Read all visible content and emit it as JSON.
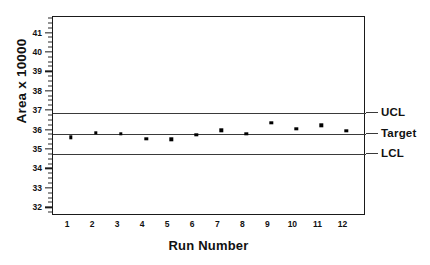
{
  "chart_data": {
    "type": "scatter",
    "title": "",
    "xlabel": "Run Number",
    "ylabel": "Area x 10000",
    "xlim": [
      0.4,
      12.9
    ],
    "ylim": [
      31.6,
      41.85
    ],
    "grid": false,
    "legend_position": "right-outside",
    "x": [
      1,
      2,
      3,
      4,
      5,
      6,
      7,
      8,
      9,
      10,
      11,
      12
    ],
    "categories": [
      "1",
      "2",
      "3",
      "4",
      "5",
      "6",
      "7",
      "8",
      "9",
      "10",
      "11",
      "12"
    ],
    "series": [
      {
        "name": "Area",
        "values": [
          35.66,
          35.89,
          35.83,
          35.58,
          35.55,
          35.77,
          36.02,
          35.82,
          36.4,
          36.1,
          36.28,
          36.0
        ]
      }
    ],
    "reference_lines": [
      {
        "name": "UCL",
        "label": "UCL",
        "value": 36.9
      },
      {
        "name": "Target",
        "label": "Target",
        "value": 35.82
      },
      {
        "name": "LCL",
        "label": "LCL",
        "value": 34.8
      }
    ],
    "y_ticks": [
      32,
      33,
      34,
      35,
      36,
      37,
      38,
      39,
      40,
      41
    ],
    "y_tick_labels": [
      "32",
      "33",
      "34",
      "35",
      "36",
      "37",
      "38",
      "39",
      "40",
      "41"
    ],
    "y_minor_tick_step": 0.25,
    "x_ticks": [
      1,
      2,
      3,
      4,
      5,
      6,
      7,
      8,
      9,
      10,
      11,
      12
    ],
    "x_tick_labels": [
      "1",
      "2",
      "3",
      "4",
      "5",
      "6",
      "7",
      "8",
      "9",
      "10",
      "11",
      "12"
    ],
    "colors": {
      "marker": "#000000",
      "limit_line": "#3a3a3a",
      "frame": "#1a1a1a",
      "text": "#111111",
      "background": "#ffffff"
    }
  }
}
